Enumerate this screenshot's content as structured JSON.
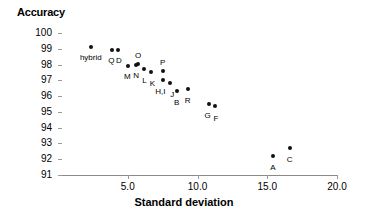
{
  "chart_data": {
    "type": "scatter",
    "title": "",
    "xlabel": "Standard deviation",
    "ylabel": "Accuracy",
    "xlim": [
      0.0,
      20.0
    ],
    "ylim": [
      91,
      100
    ],
    "xticks": [
      "5.0",
      "10.0",
      "15.0",
      "20.0"
    ],
    "xtick_values": [
      5.0,
      10.0,
      15.0,
      20.0
    ],
    "yticks": [
      "100",
      "99",
      "98",
      "97",
      "96",
      "95",
      "94",
      "93",
      "92",
      "91"
    ],
    "ytick_values": [
      100,
      99,
      98,
      97,
      96,
      95,
      94,
      93,
      92,
      91
    ],
    "grid": false,
    "legend": "none",
    "marker": "filled-diamond",
    "marker_color": "#111111",
    "points": [
      {
        "label": "hybrid",
        "x": 2.35,
        "y": 99.1,
        "label_dx": 0,
        "label_dy": 6
      },
      {
        "label": "Q",
        "x": 3.9,
        "y": 98.95,
        "label_dx": -1,
        "label_dy": 6
      },
      {
        "label": "D",
        "x": 4.3,
        "y": 98.95,
        "label_dx": 1,
        "label_dy": 6
      },
      {
        "label": "M",
        "x": 5.05,
        "y": 97.9,
        "label_dx": -1,
        "label_dy": 6
      },
      {
        "label": "N",
        "x": 5.6,
        "y": 98.0,
        "label_dx": 0,
        "label_dy": 6
      },
      {
        "label": "O",
        "x": 5.75,
        "y": 98.05,
        "label_dx": 0,
        "label_dy": -13
      },
      {
        "label": "L",
        "x": 6.2,
        "y": 97.7,
        "label_dx": 0,
        "label_dy": 7
      },
      {
        "label": "K",
        "x": 6.7,
        "y": 97.55,
        "label_dx": 1,
        "label_dy": 7
      },
      {
        "label": "P",
        "x": 7.5,
        "y": 97.62,
        "label_dx": 0,
        "label_dy": -13
      },
      {
        "label": "H,I",
        "x": 7.55,
        "y": 97.0,
        "label_dx": -3,
        "label_dy": 7
      },
      {
        "label": "J",
        "x": 8.05,
        "y": 96.85,
        "label_dx": 2,
        "label_dy": 7
      },
      {
        "label": "B",
        "x": 8.5,
        "y": 96.3,
        "label_dx": 0,
        "label_dy": 7
      },
      {
        "label": "R",
        "x": 9.3,
        "y": 96.42,
        "label_dx": 0,
        "label_dy": 7
      },
      {
        "label": "G",
        "x": 10.8,
        "y": 95.5,
        "label_dx": -1,
        "label_dy": 7
      },
      {
        "label": "F",
        "x": 11.25,
        "y": 95.4,
        "label_dx": 1,
        "label_dy": 8
      },
      {
        "label": "A",
        "x": 15.4,
        "y": 92.18,
        "label_dx": 0,
        "label_dy": 7
      },
      {
        "label": "C",
        "x": 16.6,
        "y": 92.72,
        "label_dx": 0,
        "label_dy": 7
      }
    ]
  },
  "axes": {
    "y_title": "Accuracy",
    "x_title": "Standard deviation"
  },
  "colors": {
    "marker": "#111111",
    "axis_line": "#8a8a8a",
    "text": "#000000",
    "background": "#ffffff"
  }
}
